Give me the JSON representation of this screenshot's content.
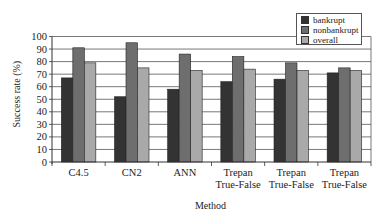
{
  "chart_data": {
    "type": "bar",
    "title": "",
    "xlabel": "Method",
    "ylabel": "Success rate (%)",
    "ylim": [
      0,
      100
    ],
    "yticks": [
      0,
      10,
      20,
      30,
      40,
      50,
      60,
      70,
      80,
      90,
      100
    ],
    "grid": true,
    "legend_position": "top-right",
    "categories": [
      "C4.5",
      "CN2",
      "ANN",
      "Trepan True-False",
      "Trepan True-False",
      "Trepan True-False"
    ],
    "category_lines": [
      [
        "C4.5"
      ],
      [
        "CN2"
      ],
      [
        "ANN"
      ],
      [
        "Trepan",
        "True-False"
      ],
      [
        "Trepan",
        "True-False"
      ],
      [
        "Trepan",
        "True-False"
      ]
    ],
    "series": [
      {
        "name": "bankrupt",
        "color": "#333333",
        "values": [
          67,
          52,
          58,
          64,
          66,
          71
        ]
      },
      {
        "name": "nonbankrupt",
        "color": "#6e6e6e",
        "values": [
          91,
          95,
          86,
          84,
          79,
          75
        ]
      },
      {
        "name": "overall",
        "color": "#a9a9a9",
        "values": [
          79,
          75,
          73,
          74,
          73,
          73
        ]
      }
    ]
  },
  "legend": {
    "items": [
      {
        "label": "bankrupt",
        "color": "#333333"
      },
      {
        "label": "nonbankrupt",
        "color": "#6e6e6e"
      },
      {
        "label": "overall",
        "color": "#a9a9a9"
      }
    ]
  }
}
